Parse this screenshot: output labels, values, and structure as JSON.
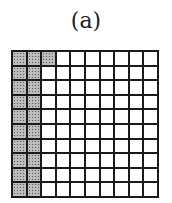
{
  "figure": {
    "label": "(a)",
    "grid": {
      "rows": 10,
      "cols": 10,
      "shaded_count": 21,
      "shaded_cells": [
        [
          0,
          0
        ],
        [
          0,
          1
        ],
        [
          0,
          2
        ],
        [
          1,
          0
        ],
        [
          1,
          1
        ],
        [
          2,
          0
        ],
        [
          2,
          1
        ],
        [
          3,
          0
        ],
        [
          3,
          1
        ],
        [
          4,
          0
        ],
        [
          4,
          1
        ],
        [
          5,
          0
        ],
        [
          5,
          1
        ],
        [
          6,
          0
        ],
        [
          6,
          1
        ],
        [
          7,
          0
        ],
        [
          7,
          1
        ],
        [
          8,
          0
        ],
        [
          8,
          1
        ],
        [
          9,
          0
        ],
        [
          9,
          1
        ]
      ],
      "shade_color": "#bdbdbd",
      "line_color": "#1a1a1a"
    }
  }
}
